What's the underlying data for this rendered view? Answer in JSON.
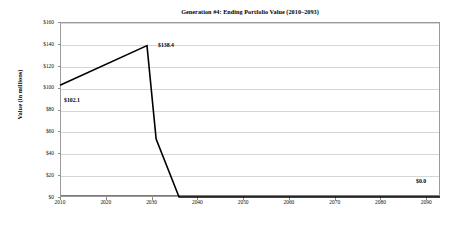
{
  "chart_data": {
    "type": "line",
    "title": "Generation #4: Ending Portfolio Value (2010–2093)",
    "xlabel": "",
    "ylabel": "Value (in millions)",
    "xlim": [
      2010,
      2093
    ],
    "ylim": [
      0,
      160
    ],
    "grid": true,
    "legend": null,
    "y_ticks": [
      160,
      140,
      120,
      100,
      80,
      60,
      40,
      20,
      0
    ],
    "y_tick_labels": [
      "$160",
      "$140",
      "$120",
      "$100",
      "$80",
      "$60",
      "$40",
      "$20",
      "$0"
    ],
    "x_ticks": [
      2010,
      2020,
      2030,
      2040,
      2050,
      2060,
      2070,
      2080,
      2090
    ],
    "x_tick_labels": [
      "2010",
      "2020",
      "2030",
      "2040",
      "2050",
      "2060",
      "2070",
      "2080",
      "2090"
    ],
    "series": [
      {
        "name": "Ending Portfolio Value",
        "color": "#000000",
        "x": [
          2010,
          2029,
          2031,
          2036,
          2093
        ],
        "values": [
          102.1,
          138.4,
          53.0,
          0.0,
          0.0
        ]
      }
    ],
    "annotations": [
      {
        "id": "start",
        "text": "$102.1",
        "x": 2010,
        "y": 102.1
      },
      {
        "id": "peak",
        "text": "$138.4",
        "x": 2029,
        "y": 138.4
      },
      {
        "id": "end",
        "text": "$0.0",
        "x": 2093,
        "y": 0.0
      }
    ]
  },
  "colors": {
    "series_line": "#000000",
    "gridline": "#d6d6d6",
    "axis": "#8a8a8a",
    "background": "#ffffff",
    "text": "#000000"
  }
}
